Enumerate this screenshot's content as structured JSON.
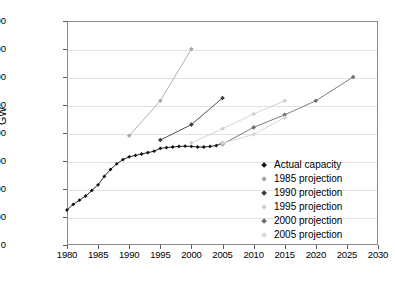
{
  "chart_data": {
    "type": "line",
    "title": "",
    "xlabel": "",
    "ylabel": "GW",
    "xlim": [
      1980,
      2030
    ],
    "ylim": [
      0,
      800
    ],
    "ytick_step": 100,
    "xtick_step": 5,
    "grid": true,
    "legend_position": "inside-bottom-right",
    "yticks": [
      "0",
      "100",
      "200",
      "300",
      "400",
      "500",
      "600",
      "700",
      "800"
    ],
    "xticks": [
      "1980",
      "1985",
      "1990",
      "1995",
      "2000",
      "2005",
      "2010",
      "2015",
      "2020",
      "2025",
      "2030"
    ],
    "series": [
      {
        "name": "Actual capacity",
        "color": "#111111",
        "marker": "diamond",
        "x": [
          1980,
          1981,
          1982,
          1983,
          1984,
          1985,
          1986,
          1987,
          1988,
          1989,
          1990,
          1991,
          1992,
          1993,
          1994,
          1995,
          1996,
          1997,
          1998,
          1999,
          2000,
          2001,
          2002,
          2003,
          2004,
          2005
        ],
        "values": [
          125,
          145,
          160,
          175,
          195,
          215,
          245,
          270,
          290,
          305,
          315,
          320,
          325,
          330,
          335,
          345,
          348,
          350,
          352,
          353,
          352,
          350,
          350,
          352,
          355,
          365
        ]
      },
      {
        "name": "1985 projection",
        "color": "#a8a8a8",
        "marker": "diamond",
        "x": [
          1990,
          1995,
          2000
        ],
        "values": [
          390,
          515,
          700
        ]
      },
      {
        "name": "1990 projection",
        "color": "#3c3c3c",
        "marker": "diamond",
        "x": [
          1995,
          2000,
          2005
        ],
        "values": [
          375,
          430,
          525
        ]
      },
      {
        "name": "1995 projection",
        "color": "#cfcfcf",
        "marker": "diamond",
        "x": [
          2000,
          2005,
          2010,
          2015
        ],
        "values": [
          365,
          415,
          468,
          515
        ]
      },
      {
        "name": "2000 projection",
        "color": "#6e6e6e",
        "marker": "diamond",
        "x": [
          2005,
          2010,
          2015,
          2020,
          2026
        ],
        "values": [
          360,
          420,
          465,
          515,
          600
        ]
      },
      {
        "name": "2005 projection",
        "color": "#d6d6d6",
        "marker": "diamond",
        "x": [
          2005,
          2010,
          2015
        ],
        "values": [
          363,
          395,
          455
        ]
      }
    ]
  },
  "legend": {
    "items": [
      {
        "label": "Actual capacity",
        "color": "#111111"
      },
      {
        "label": "1985 projection",
        "color": "#a8a8a8"
      },
      {
        "label": "1990 projection",
        "color": "#3c3c3c"
      },
      {
        "label": "1995 projection",
        "color": "#cfcfcf"
      },
      {
        "label": "2000 projection",
        "color": "#6e6e6e"
      },
      {
        "label": "2005 projection",
        "color": "#d6d6d6"
      }
    ]
  }
}
